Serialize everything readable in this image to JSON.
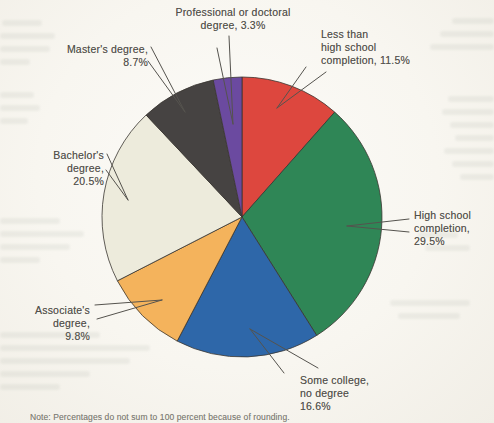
{
  "chart_data": {
    "type": "pie",
    "title": "",
    "direction": "clockwise",
    "start_angle_deg": 0,
    "note": "Note: Percentages do not sum to 100 percent because of rounding.",
    "slices": [
      {
        "name": "less-than-high-school",
        "label": "Less than high school completion",
        "value": 11.5,
        "color": "#dd473e",
        "label_lines": [
          "Less than",
          "high school",
          "completion, 11.5%"
        ]
      },
      {
        "name": "high-school-completion",
        "label": "High school completion",
        "value": 29.5,
        "color": "#2f8656",
        "label_lines": [
          "High school",
          "completion,",
          "29.5%"
        ]
      },
      {
        "name": "some-college-no-degree",
        "label": "Some college, no degree",
        "value": 16.6,
        "color": "#2e67a9",
        "label_lines": [
          "Some college,",
          "no degree",
          "16.6%"
        ]
      },
      {
        "name": "associates-degree",
        "label": "Associate's degree",
        "value": 9.8,
        "color": "#f4b35c",
        "label_lines": [
          "Associate's",
          "degree,",
          "9.8%"
        ]
      },
      {
        "name": "bachelors-degree",
        "label": "Bachelor's degree",
        "value": 20.5,
        "color": "#edebdc",
        "label_lines": [
          "Bachelor's",
          "degree,",
          "20.5%"
        ]
      },
      {
        "name": "masters-degree",
        "label": "Master's degree",
        "value": 8.7,
        "color": "#464342",
        "label_lines": [
          "Master's degree,",
          "8.7%"
        ]
      },
      {
        "name": "professional-or-doctoral",
        "label": "Professional or doctoral degree",
        "value": 3.3,
        "color": "#6b4aa0",
        "label_lines": [
          "Professional or doctoral",
          "degree, 3.3%"
        ]
      }
    ],
    "colors": {
      "outline": "#3a3631",
      "leader_line": "#55534e",
      "ink": "#53514c",
      "paper": "#f8f6f0"
    }
  }
}
